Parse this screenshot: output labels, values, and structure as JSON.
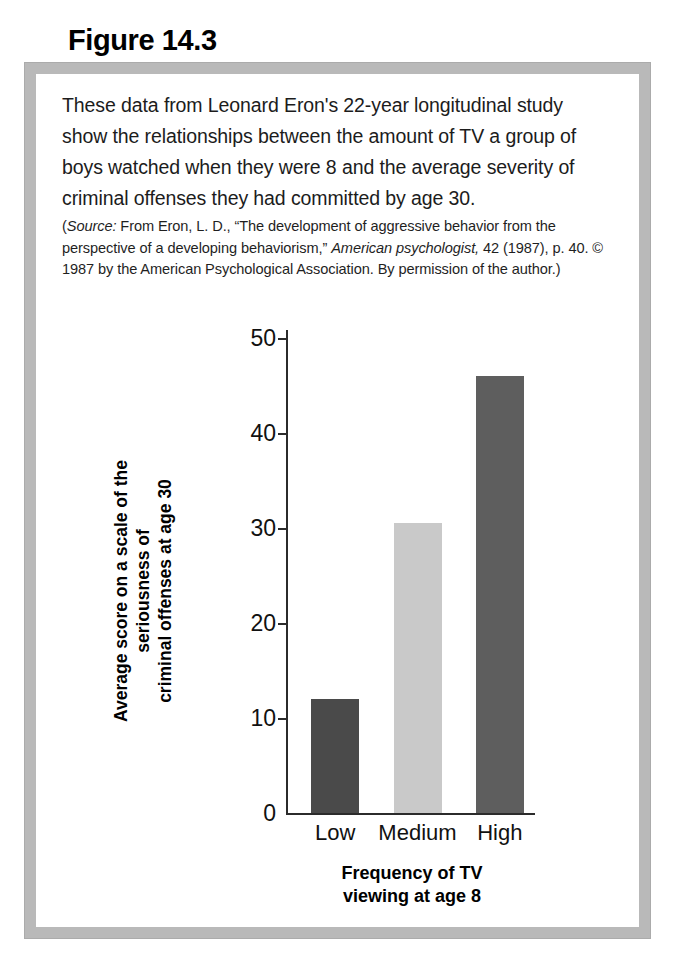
{
  "figure": {
    "number_label": "Figure 14.3",
    "caption": "These data from Leonard Eron's 22-year longitudinal study show the relationships between the amount of TV a group of boys watched when they were 8 and the average severity of criminal offenses they had committed by age 30.",
    "source_note": {
      "label": "Source:",
      "part1": " From Eron, L. D., “The development of aggressive behavior from the perspective of a developing behaviorism,” ",
      "journal": "American psychologist,",
      "part2": " 42 (1987), p. 40. © 1987 by the American Psychological Association. By permission of the author.)",
      "open_paren": "("
    }
  },
  "chart_data": {
    "type": "bar",
    "title": "",
    "categories": [
      "Low",
      "Medium",
      "High"
    ],
    "values": [
      12,
      30.5,
      46
    ],
    "xlabel": "Frequency of TV viewing at age 8",
    "xlabel_line1": "Frequency of TV",
    "xlabel_line2": "viewing at age 8",
    "ylabel": "Average score on a scale of the seriousness of criminal offenses at age 30",
    "ylabel_line1": "Average score on a scale of the seriousness of",
    "ylabel_line2": "criminal offenses at age 30",
    "ylim": [
      0,
      50
    ],
    "yticks": [
      0,
      10,
      20,
      30,
      40,
      50
    ],
    "ytick_labels": [
      "0",
      "10",
      "20",
      "30",
      "40",
      "50"
    ],
    "grid": false,
    "legend": "none",
    "bar_colors": [
      "#4a4a4a",
      "#c9c9c9",
      "#5e5e5e"
    ]
  },
  "colors": {
    "frame_border": "#b9b9b9",
    "page_background": "#ffffff",
    "axis": "#2b2b2b",
    "text": "#1c1c1c"
  }
}
